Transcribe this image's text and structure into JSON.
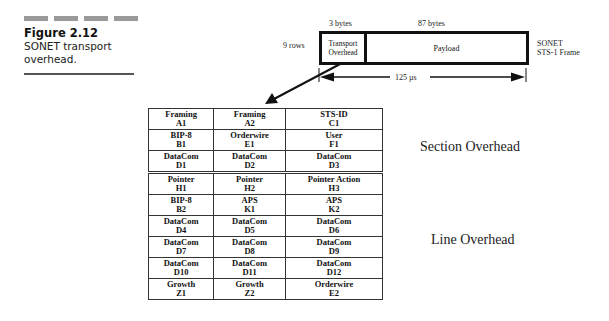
{
  "figure": {
    "number": "Figure 2.12",
    "caption": "SONET transport overhead."
  },
  "frame_diagram": {
    "col_label_overhead": "3 bytes",
    "col_label_payload": "87 bytes",
    "row_label": "9 rows",
    "overhead_label": "Transport Overhead",
    "overhead_label_line1": "Transport",
    "overhead_label_line2": "Overhead",
    "payload_label": "Payload",
    "frame_name_line1": "SONET",
    "frame_name_line2": "STS-1 Frame",
    "duration": "125 µs"
  },
  "overhead_table": {
    "section_rows": [
      [
        {
          "name": "Framing",
          "code": "A1"
        },
        {
          "name": "Framing",
          "code": "A2"
        },
        {
          "name": "STS-ID",
          "code": "C1"
        }
      ],
      [
        {
          "name": "BIP-8",
          "code": "B1"
        },
        {
          "name": "Orderwire",
          "code": "E1"
        },
        {
          "name": "User",
          "code": "F1"
        }
      ],
      [
        {
          "name": "DataCom",
          "code": "D1"
        },
        {
          "name": "DataCom",
          "code": "D2"
        },
        {
          "name": "DataCom",
          "code": "D3"
        }
      ]
    ],
    "line_rows": [
      [
        {
          "name": "Pointer",
          "code": "H1"
        },
        {
          "name": "Pointer",
          "code": "H2"
        },
        {
          "name": "Pointer Action",
          "code": "H3"
        }
      ],
      [
        {
          "name": "BIP-8",
          "code": "B2"
        },
        {
          "name": "APS",
          "code": "K1"
        },
        {
          "name": "APS",
          "code": "K2"
        }
      ],
      [
        {
          "name": "DataCom",
          "code": "D4"
        },
        {
          "name": "DataCom",
          "code": "D5"
        },
        {
          "name": "DataCom",
          "code": "D6"
        }
      ],
      [
        {
          "name": "DataCom",
          "code": "D7"
        },
        {
          "name": "DataCom",
          "code": "D8"
        },
        {
          "name": "DataCom",
          "code": "D9"
        }
      ],
      [
        {
          "name": "DataCom",
          "code": "D10"
        },
        {
          "name": "DataCom",
          "code": "D11"
        },
        {
          "name": "DataCom",
          "code": "D12"
        }
      ],
      [
        {
          "name": "Growth",
          "code": "Z1"
        },
        {
          "name": "Growth",
          "code": "Z2"
        },
        {
          "name": "Orderwire",
          "code": "E2"
        }
      ]
    ]
  },
  "region_labels": {
    "section": "Section Overhead",
    "line": "Line Overhead"
  },
  "colors": {
    "ink": "#111111",
    "caption_bar": "#9a9a9a",
    "background": "#ffffff"
  }
}
